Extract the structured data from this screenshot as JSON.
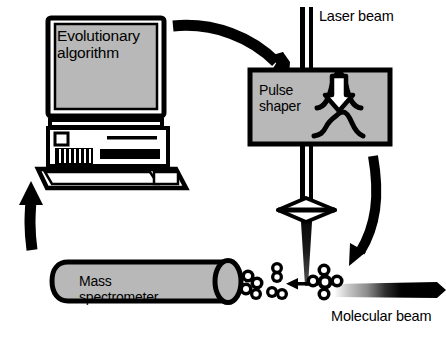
{
  "figure": {
    "type": "schematic-diagram",
    "background_color": "#ffffff",
    "ink_color": "#000000",
    "fill_gray": "#b8b8b8"
  },
  "computer": {
    "screen_label": "Evolutionary\nalgorithm",
    "screen_fill": "#b8b8b8",
    "parts": [
      "monitor",
      "screen",
      "tower-case",
      "power-button",
      "vent-grille",
      "drive-slot",
      "keyboard"
    ]
  },
  "pulse_shaper": {
    "label": "Pulse\nshaper",
    "fill": "#b8b8b8",
    "inset_icons": [
      "narrow-pulse-with-down-arrow",
      "shaped-asymmetric-pulse"
    ]
  },
  "mass_spectrometer": {
    "label": "Mass\nspectrometer",
    "fill": "#b8b8b8",
    "shape": "horizontal-cylinder"
  },
  "laser": {
    "label": "Laser beam",
    "beam_style": "two-parallel-vertical-bars"
  },
  "molecular_beam": {
    "label": "Molecular beam",
    "beam_style": "thick-horizontal-bar-fading-left"
  },
  "arrows": {
    "computer_to_shaper": "curved-arrow-right-down",
    "shaper_to_interaction": "curved-arrow-down",
    "spectrometer_to_computer": "straight-arrow-up",
    "fragments_to_spectrometer": "short-arrow-left"
  },
  "interaction_region": {
    "lens": "focusing-lens",
    "intact_molecule": "molecule-cluster",
    "fragments": [
      "fragment-pair-upper",
      "fragment-pair-lower",
      "fragment-cluster"
    ]
  }
}
